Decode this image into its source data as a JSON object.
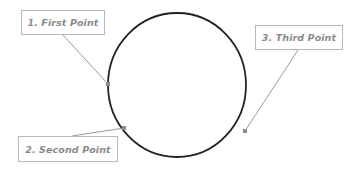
{
  "diagram": {
    "type": "circle-with-labeled-points",
    "circle": {
      "cx": 177,
      "cy": 85,
      "rx": 69,
      "ry": 72,
      "stroke": "#222222",
      "stroke_width": 1.8
    },
    "leader_color": "#9a9a9a",
    "point_color": "#8c8c8c",
    "label_border_color": "#b8b8b8",
    "label_text_color": "#8a8a8a",
    "points": [
      {
        "id": "first",
        "label": "1. First Point",
        "x": 108,
        "y": 84,
        "box": {
          "x": 21,
          "y": 10,
          "w": 84,
          "h": 25
        },
        "leader_from": {
          "x": 63,
          "y": 35
        }
      },
      {
        "id": "second",
        "label": "2. Second Point",
        "x": 124,
        "y": 128,
        "box": {
          "x": 18,
          "y": 136,
          "w": 100,
          "h": 26
        },
        "leader_from": {
          "x": 72,
          "y": 136
        }
      },
      {
        "id": "third",
        "label": "3. Third Point",
        "x": 245,
        "y": 131,
        "box": {
          "x": 255,
          "y": 25,
          "w": 88,
          "h": 25
        },
        "leader_from": {
          "x": 298,
          "y": 50
        }
      }
    ]
  }
}
